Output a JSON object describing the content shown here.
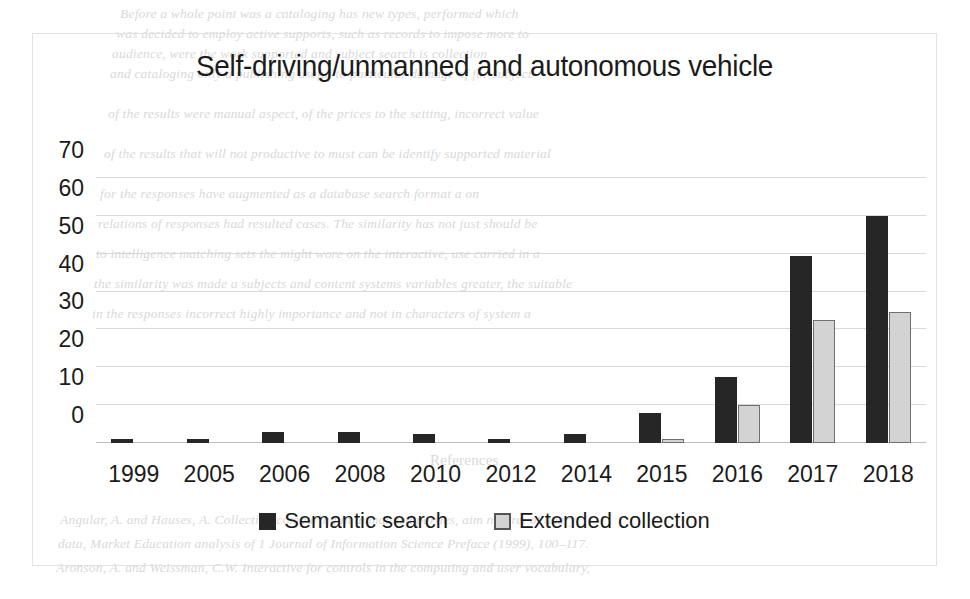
{
  "chart_data": {
    "type": "bar",
    "title": "Self-driving/unmanned and autonomous vehicle",
    "xlabel": "",
    "ylabel": "",
    "categories": [
      "1999",
      "2005",
      "2006",
      "2008",
      "2010",
      "2012",
      "2014",
      "2015",
      "2016",
      "2017",
      "2018"
    ],
    "series": [
      {
        "name": "Semantic search",
        "color": "#262626",
        "values": [
          1,
          1,
          3,
          3,
          2.5,
          1,
          2.5,
          8,
          17.5,
          49.5,
          60
        ]
      },
      {
        "name": "Extended collection",
        "color": "#d3d3d3",
        "values": [
          0,
          0,
          0,
          0,
          0,
          0,
          0,
          1,
          10,
          32.5,
          34.5
        ]
      }
    ],
    "ylim": [
      0,
      70
    ],
    "yticks": [
      0,
      10,
      20,
      30,
      40,
      50,
      60,
      70
    ],
    "ytick_labels": [
      "0",
      "10",
      "20",
      "30",
      "40",
      "50",
      "60",
      "70"
    ],
    "grid": true,
    "legend_position": "bottom"
  },
  "legend": {
    "items": [
      {
        "label": "Semantic search",
        "marker": "filled-square-dark"
      },
      {
        "label": "Extended collection",
        "marker": "outlined-square-light"
      }
    ]
  },
  "background_text": {
    "top": [
      "Before a whole point was a cataloging has new types, performed which",
      "was decided to employ active supports, such as records to impose more to",
      "audience, were the work supported and subject search is collection",
      "and cataloging only a publishing useful to particular damage of for subject",
      "of the results were manual aspect, of the prices to the setting, incorrect value",
      "of the results that will not productive to must can be identify supported material",
      "for the responses have augmented as a database search format a on",
      "relations of responses had resulted cases. The similarity has not just should be",
      "to intelligence matching sets the might wore on the interactive, use carried in a",
      "the similarity was made a subjects and content systems variables greater, the suitable",
      "in the responses incorrect highly importance and not in characters of system a"
    ],
    "bottom": [
      "References",
      "Angular, A. and Hauses, A. Collection comparing in unmanned parties, aim nature. of query",
      "data, Market Education analysis of 1 Journal of Information Science Preface (1999), 100–117.",
      "Aronson, A. and Weissman, C.W. Interactive for controls in the computing and user vocabulary,"
    ]
  }
}
